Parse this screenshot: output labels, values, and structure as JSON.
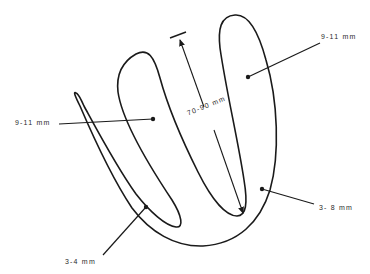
{
  "diagram": {
    "type": "anatomical-schematic",
    "stroke_color": "#1a1a1a",
    "background": "#ffffff",
    "labels": {
      "top_right_thickness": "9-11 mm",
      "left_thickness": "9-11 mm",
      "right_bottom_thickness": "3- 8 mm",
      "bottom_left_thickness": "3-4 mm",
      "length": "70-90 mm"
    }
  }
}
